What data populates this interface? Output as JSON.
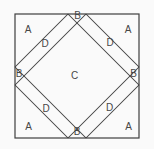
{
  "figure": {
    "colors": {
      "background": "#fafafa",
      "line": "#3e3e3e",
      "label": "#474747"
    },
    "square": {
      "x": 15,
      "y": 14,
      "width": 124,
      "height": 124
    },
    "lines": [
      {
        "id": "line-corner-cut-top-left",
        "x1": 68,
        "y1": 14,
        "x2": 15,
        "y2": 67
      },
      {
        "id": "line-band-inner-top-left",
        "x1": 86,
        "y1": 14,
        "x2": 15,
        "y2": 85
      },
      {
        "id": "line-corner-cut-top-right",
        "x1": 86,
        "y1": 14,
        "x2": 139,
        "y2": 67
      },
      {
        "id": "line-band-inner-top-right",
        "x1": 68,
        "y1": 14,
        "x2": 139,
        "y2": 85
      },
      {
        "id": "line-corner-cut-bottom-left",
        "x1": 15,
        "y1": 85,
        "x2": 68,
        "y2": 138
      },
      {
        "id": "line-band-inner-bottom-left",
        "x1": 15,
        "y1": 67,
        "x2": 86,
        "y2": 138
      },
      {
        "id": "line-corner-cut-bottom-right",
        "x1": 139,
        "y1": 85,
        "x2": 86,
        "y2": 138
      },
      {
        "id": "line-band-inner-bottom-right",
        "x1": 139,
        "y1": 67,
        "x2": 68,
        "y2": 138
      }
    ],
    "labels": [
      {
        "id": "label-a-top-left",
        "text": "A",
        "x": 28,
        "y": 29.5
      },
      {
        "id": "label-a-top-right",
        "text": "A",
        "x": 128,
        "y": 29.5
      },
      {
        "id": "label-a-bottom-left",
        "text": "A",
        "x": 28.5,
        "y": 126.5
      },
      {
        "id": "label-a-bottom-right",
        "text": "A",
        "x": 128.5,
        "y": 127
      },
      {
        "id": "label-b-top",
        "text": "B",
        "x": 77.5,
        "y": 15.5
      },
      {
        "id": "label-b-left",
        "text": "B",
        "x": 19,
        "y": 74
      },
      {
        "id": "label-b-right",
        "text": "B",
        "x": 133.5,
        "y": 73.5
      },
      {
        "id": "label-b-bottom",
        "text": "B",
        "x": 77,
        "y": 132
      },
      {
        "id": "label-c-center",
        "text": "C",
        "x": 74.5,
        "y": 75.5
      },
      {
        "id": "label-d-top-left",
        "text": "D",
        "x": 45,
        "y": 44
      },
      {
        "id": "label-d-top-right",
        "text": "D",
        "x": 110,
        "y": 42.5
      },
      {
        "id": "label-d-bottom-left",
        "text": "D",
        "x": 46,
        "y": 109
      },
      {
        "id": "label-d-bottom-right",
        "text": "D",
        "x": 109.5,
        "y": 108
      }
    ]
  }
}
